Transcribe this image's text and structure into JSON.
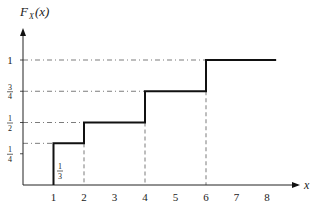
{
  "chart_data": {
    "type": "line",
    "subtype": "step",
    "title": "",
    "ylabel": "F_X(x)",
    "xlabel": "x",
    "x_ticks": [
      "1",
      "2",
      "3",
      "4",
      "5",
      "6",
      "7",
      "8"
    ],
    "y_ticks": [
      {
        "value": 0.25,
        "num": "1",
        "den": "4"
      },
      {
        "value": 0.5,
        "num": "1",
        "den": "2"
      },
      {
        "value": 0.75,
        "num": "3",
        "den": "4"
      },
      {
        "value": 1,
        "label": "1"
      }
    ],
    "xlim": [
      0,
      8.6
    ],
    "ylim": [
      0,
      1.2
    ],
    "grid": false,
    "steps": [
      {
        "x_start": 1,
        "x_end": 2,
        "y": 0.3333
      },
      {
        "x_start": 2,
        "x_end": 4,
        "y": 0.5
      },
      {
        "x_start": 4,
        "x_end": 6,
        "y": 0.75
      },
      {
        "x_start": 6,
        "x_end": 8.3,
        "y": 1
      }
    ],
    "jump_points": [
      1,
      2,
      4,
      6
    ],
    "annotations": [
      {
        "text": "1/3",
        "num": "1",
        "den": "3",
        "x": 1,
        "y": 0.1667
      }
    ],
    "dash_dot_guides": "horizontal guides from y-axis to each step level; vertical dashed guides from each jump down to x-axis"
  },
  "labels": {
    "y_axis_F": "F",
    "y_axis_sub": "X",
    "y_axis_arg": "(x)",
    "x_axis": "x",
    "step_annotation_num": "1",
    "step_annotation_den": "3"
  }
}
